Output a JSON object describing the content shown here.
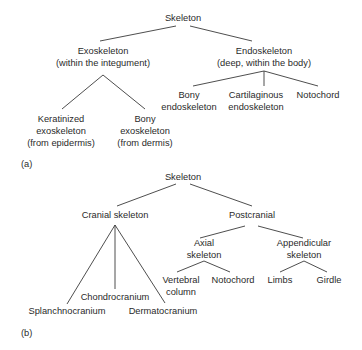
{
  "panel_a": {
    "label": "(a)",
    "root": "Skeleton",
    "exoskeleton": {
      "line1": "Exoskeleton",
      "line2": "(within the integument)"
    },
    "endoskeleton": {
      "line1": "Endoskeleton",
      "line2": "(deep, within the body)"
    },
    "keratinized": {
      "line1": "Keratinized",
      "line2": "exoskeleton",
      "line3": "(from epidermis)"
    },
    "bony_exo": {
      "line1": "Bony",
      "line2": "exoskeleton",
      "line3": "(from dermis)"
    },
    "bony_endo": {
      "line1": "Bony",
      "line2": "endoskeleton"
    },
    "cartilaginous_endo": {
      "line1": "Cartilaginous",
      "line2": "endoskeleton"
    },
    "notochord": "Notochord"
  },
  "panel_b": {
    "label": "(b)",
    "root": "Skeleton",
    "cranial": "Cranial skeleton",
    "postcranial": "Postcranial",
    "chondrocranium": "Chondrocranium",
    "splanchnocranium": "Splanchnocranium",
    "dermatocranium": "Dermatocranium",
    "axial": {
      "line1": "Axial",
      "line2": "skeleton"
    },
    "appendicular": {
      "line1": "Appendicular",
      "line2": "skeleton"
    },
    "vertebral": {
      "line1": "Vertebral",
      "line2": "column"
    },
    "notochord": "Notochord",
    "limbs": "Limbs",
    "girdle": "Girdle"
  }
}
